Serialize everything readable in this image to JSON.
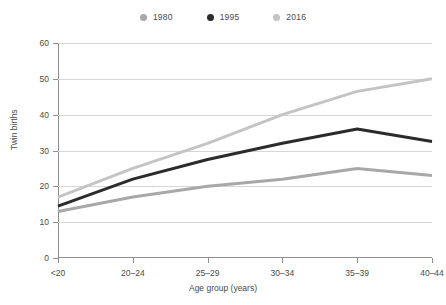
{
  "chart_data": {
    "type": "line",
    "title": "",
    "xlabel": "Age group (years)",
    "ylabel": "Twin births",
    "categories": [
      "<20",
      "20–24",
      "25–29",
      "30–34",
      "35–39",
      "40–44"
    ],
    "xlim": [
      0,
      5
    ],
    "ylim": [
      0,
      60
    ],
    "yticks": [
      0,
      10,
      20,
      30,
      40,
      50,
      60
    ],
    "grid": "horizontal",
    "legend_position": "top-center",
    "series": [
      {
        "name": "1980",
        "color": "#a8a8a8",
        "values": [
          13,
          17,
          20,
          22,
          25,
          23
        ]
      },
      {
        "name": "1995",
        "color": "#2b2b2b",
        "values": [
          14.5,
          22,
          27.5,
          32,
          36,
          32.5
        ]
      },
      {
        "name": "2016",
        "color": "#c4c4c4",
        "values": [
          17,
          25,
          32,
          40,
          46.5,
          50
        ]
      }
    ]
  },
  "legend": {
    "items": [
      {
        "label": "1980",
        "color": "#a8a8a8",
        "marker": "circle-dot-icon"
      },
      {
        "label": "1995",
        "color": "#2b2b2b",
        "marker": "circle-dot-icon"
      },
      {
        "label": "2016",
        "color": "#c4c4c4",
        "marker": "circle-dot-icon"
      }
    ]
  },
  "axes": {
    "y_title": "Twin births",
    "x_title": "Age group (years)",
    "y_tick_labels": [
      "0",
      "10",
      "20",
      "30",
      "40",
      "50",
      "60"
    ],
    "x_tick_labels": [
      "<20",
      "20–24",
      "25–29",
      "30–34",
      "35–39",
      "40–44"
    ]
  },
  "colors": {
    "axis": "#8d8d8d",
    "grid": "#d6d6d6",
    "text": "#4a4a4a",
    "background": "#ffffff"
  }
}
